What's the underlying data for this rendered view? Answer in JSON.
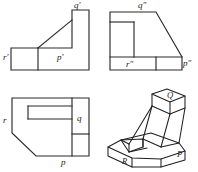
{
  "figure": {
    "line_color": "#2b2b2b",
    "background_color": "#ffffff"
  },
  "views": {
    "front": {
      "name": "front-elevation-view",
      "labels": {
        "q_prime": "q'",
        "r_prime": "r'",
        "p_prime": "p'"
      }
    },
    "side": {
      "name": "side-elevation-view",
      "labels": {
        "q_double_prime": "q″",
        "r_double_prime": "r″",
        "p_double_prime": "p″"
      }
    },
    "top": {
      "name": "top-plan-view",
      "labels": {
        "r": "r",
        "q": "q",
        "p": "p"
      }
    },
    "isometric": {
      "name": "isometric-pictorial-view",
      "labels": {
        "q": "Q",
        "r": "R",
        "p": "P"
      }
    }
  }
}
